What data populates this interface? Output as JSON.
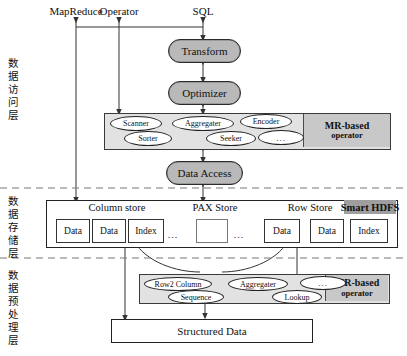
{
  "diagram": {
    "colors": {
      "capsule_fill": "#b9b9b9",
      "band_fill": "#e2e2e2",
      "tag_fill": "#c8c8c8",
      "hdfs_fill": "#9e9e9e",
      "stroke": "#222222"
    }
  },
  "top_entries": [
    {
      "label": "MapReduce"
    },
    {
      "label": "Operator"
    },
    {
      "label": "SQL"
    }
  ],
  "layers": [
    {
      "name": "access-layer",
      "label": "数据访问层"
    },
    {
      "name": "storage-layer",
      "label": "数据存储层"
    },
    {
      "name": "preprocessing-layer",
      "label": "数据预处理层"
    }
  ],
  "pipeline": [
    {
      "label": "Transform"
    },
    {
      "label": "Optimizer"
    },
    {
      "label": "Data Access"
    }
  ],
  "access_operator_band": {
    "tag_main": "MR-based",
    "tag_sub": "operator",
    "operators": [
      {
        "label": "Scanner"
      },
      {
        "label": "Sorter"
      },
      {
        "label": "Aggregater"
      },
      {
        "label": "Seeker"
      },
      {
        "label": "Encoder"
      },
      {
        "label": "..."
      }
    ]
  },
  "storage": {
    "sections": [
      {
        "label": "Column store"
      },
      {
        "label": "PAX Store"
      },
      {
        "label": "Row Store"
      }
    ],
    "smart_hdfs": "Smart HDFS",
    "column_store_items": [
      {
        "label": "Data"
      },
      {
        "label": "Data"
      },
      {
        "label": "Index"
      }
    ],
    "column_store_more": "...",
    "pax_items": [
      {
        "label": ""
      }
    ],
    "pax_more_left": "...",
    "pax_more_right": "...",
    "row_store_items": [
      {
        "label": "Data"
      }
    ],
    "hdfs_items": [
      {
        "label": "Data"
      },
      {
        "label": "Index"
      }
    ]
  },
  "preprocess_band": {
    "tag_main": "MR-based",
    "tag_sub": "operator",
    "operators": [
      {
        "label": "Row2 Column"
      },
      {
        "label": "Sequence"
      },
      {
        "label": "Aggregater"
      },
      {
        "label": "Lookup"
      },
      {
        "label": "..."
      }
    ]
  },
  "structured_data": {
    "label": "Structured Data"
  }
}
